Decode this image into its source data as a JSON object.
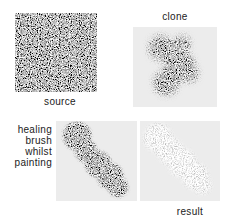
{
  "figure": {
    "labels": {
      "source": "source",
      "clone": "clone",
      "healing_brush": "healing\nbrush\nwhilst\npainting",
      "result": "result"
    },
    "images": {
      "source": "uniform-random-noise-texture-square",
      "clone": "dark-noise-blob-painted-with-clone-tool",
      "healing_brush": "dark-noise-blob-painted-with-healing-brush",
      "result": "faint-almost-healed-noise-blob"
    },
    "colors": {
      "page_background": "#ffffff",
      "panel_background": "#ececec",
      "label_text": "#222222"
    }
  }
}
